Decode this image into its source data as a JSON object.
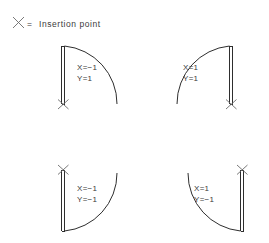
{
  "legend": {
    "icon": "x-mark-icon",
    "equals": "=",
    "label": "Insertion  point",
    "full_text": "X = Insertion point"
  },
  "colors": {
    "background": "#ffffff",
    "line": "#2e2e2e",
    "marker": "#6b6b6b",
    "text": "#3a3a3a"
  },
  "quadrants": [
    {
      "id": "top-left",
      "name": "door-top-left",
      "x_label": "X=−1",
      "y_label": "Y=1",
      "x_value": -1,
      "y_value": 1,
      "panel_side": "left",
      "insertion_point": "bottom",
      "arc_direction": "right-down"
    },
    {
      "id": "top-right",
      "name": "door-top-right",
      "x_label": "X=1",
      "y_label": "Y=1",
      "x_value": 1,
      "y_value": 1,
      "panel_side": "right",
      "insertion_point": "bottom",
      "arc_direction": "left-down"
    },
    {
      "id": "bottom-left",
      "name": "door-bottom-left",
      "x_label": "X=−1",
      "y_label": "Y=−1",
      "x_value": -1,
      "y_value": -1,
      "panel_side": "left",
      "insertion_point": "top",
      "arc_direction": "right-up"
    },
    {
      "id": "bottom-right",
      "name": "door-bottom-right",
      "x_label": "X=1",
      "y_label": "Y=−1",
      "x_value": 1,
      "y_value": -1,
      "panel_side": "right",
      "insertion_point": "top",
      "arc_direction": "left-up"
    }
  ]
}
